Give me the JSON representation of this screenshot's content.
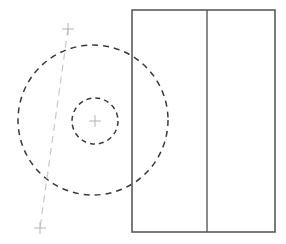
{
  "canvas": {
    "width": 286,
    "height": 244,
    "background": "#ffffff",
    "title": "Engineering drawing - circular feature with side elevation"
  },
  "colors": {
    "circle_stroke": "#3a3a3a",
    "centerline_stroke": "#c9c9c9",
    "tick_stroke": "#b5b5b5",
    "rect_stroke": "#5a5a5a",
    "rect_fill": "none"
  },
  "front_view": {
    "label": "front-view-circles",
    "outer_circle": {
      "label": "outer-bolt-circle",
      "cx": 93,
      "cy": 120,
      "r": 75,
      "stroke": "#3a3a3a",
      "stroke_width": 1.5,
      "dash": "6 5",
      "fill": "none"
    },
    "inner_circle": {
      "label": "inner-hub-circle",
      "cx": 95,
      "cy": 121,
      "r": 23,
      "stroke": "#3a3a3a",
      "stroke_width": 1.5,
      "dash": "5 4",
      "fill": "none"
    }
  },
  "centerline": {
    "label": "inclined-centerline",
    "x1": 68,
    "y1": 29,
    "x2": 40,
    "y2": 228,
    "stroke": "#c9c9c9",
    "stroke_width": 1.2,
    "dash": "7 5"
  },
  "tick_marks": [
    {
      "name": "centerline-top-tick",
      "cx": 68,
      "cy": 29,
      "size": 6
    },
    {
      "name": "center-point-tick",
      "cx": 95,
      "cy": 121,
      "size": 6
    },
    {
      "name": "centerline-bottom-tick",
      "cx": 40,
      "cy": 228,
      "size": 6
    }
  ],
  "side_view": {
    "label": "side-elevation-rectangle",
    "x": 132,
    "y": 10,
    "width": 143,
    "height": 222,
    "stroke": "#5a5a5a",
    "stroke_width": 1.6,
    "fill": "none",
    "divider": {
      "label": "vertical-divider-line",
      "x": 207,
      "y1": 10,
      "y2": 232,
      "stroke": "#5a5a5a",
      "stroke_width": 1.4
    }
  }
}
